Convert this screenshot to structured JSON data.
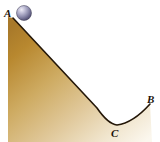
{
  "figure": {
    "name": "ball-on-incline-track",
    "width": 160,
    "height": 142,
    "background_color": "#ffffff"
  },
  "labels": {
    "a": "A",
    "b": "B",
    "c": "C"
  },
  "ball": {
    "name": "ball",
    "cx": 24,
    "cy": 13,
    "r": 7.5,
    "fill_light": "#e8e7f2",
    "fill_mid": "#9b9ab8",
    "fill_dark": "#4a4865",
    "outline_color": "#3a3850"
  },
  "terrain": {
    "name": "hill-and-valley",
    "outline_color": "#241708",
    "outline_width": 1.6,
    "fill_top": "#a8792a",
    "fill_mid": "#d4b273",
    "fill_bottom": "#f7f1e2",
    "path": "M 8 17 L 13 18 L 97 108 Q 108 124 117 125 Q 133 123 150 104 L 152 142 L 8 142 Z",
    "surface_path": "M 13 18 L 97 108 Q 108 124 117 125 Q 133 123 150 104",
    "left_edge_x": 8,
    "apex": {
      "x": 13,
      "y": 18
    },
    "valley": {
      "x": 117,
      "y": 125
    },
    "right_end": {
      "x": 150,
      "y": 104
    }
  },
  "chart_data": {
    "type": "line",
    "title": "",
    "xlabel": "",
    "ylabel": "",
    "annotations": [
      {
        "label": "A",
        "x": 13,
        "y": 18,
        "note": "top of incline, ball start"
      },
      {
        "label": "C",
        "x": 117,
        "y": 125,
        "note": "lowest point of valley"
      },
      {
        "label": "B",
        "x": 150,
        "y": 104,
        "note": "top of right rise"
      }
    ]
  }
}
